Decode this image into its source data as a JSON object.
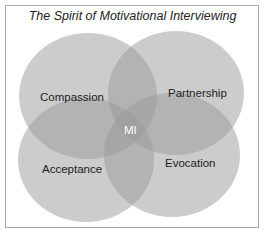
{
  "title": "The Spirit of Motivational Interviewing",
  "center_label": "MI",
  "circles": [
    {
      "label": "Compassion",
      "position": "top-left"
    },
    {
      "label": "Partnership",
      "position": "top-right"
    },
    {
      "label": "Acceptance",
      "position": "bottom-left"
    },
    {
      "label": "Evocation",
      "position": "bottom-right"
    }
  ],
  "colors": {
    "fill": "#c9c9c9",
    "border": "#a8a8a8",
    "center_text": "#ffffff"
  }
}
